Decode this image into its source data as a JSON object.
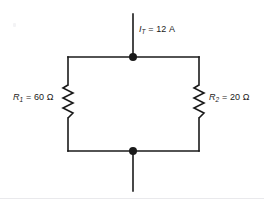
{
  "figure": {
    "type": "circuit-diagram",
    "background_color": "#ffffff",
    "line_color": "#1a1a1a"
  },
  "labels": {
    "current": {
      "symbol": "I",
      "subscript": "T",
      "equals": " = ",
      "value": "12",
      "unit": "A",
      "full_text": "IT = 12 A"
    },
    "resistor_left": {
      "symbol": "R",
      "subscript": "1",
      "equals": " = ",
      "value": "60",
      "unit": "Ω",
      "full_text": "R1 = 60 Ω"
    },
    "resistor_right": {
      "symbol": "R",
      "subscript": "2",
      "equals": " = ",
      "value": "20",
      "unit": "Ω",
      "full_text": "R2 = 20 Ω"
    }
  },
  "geometry": {
    "top_node": {
      "x": 133,
      "y": 57,
      "radius": 4
    },
    "bottom_node": {
      "x": 133,
      "y": 151,
      "radius": 4
    },
    "top_lead": {
      "x": 133,
      "y1": 14,
      "y2": 57
    },
    "bottom_lead": {
      "x": 133,
      "y1": 151,
      "y2": 191
    },
    "top_wire": {
      "y": 57,
      "x1": 68,
      "x2": 199
    },
    "bottom_wire": {
      "y": 151,
      "x1": 68,
      "x2": 199
    },
    "left_branch_x": 68,
    "right_branch_x": 199,
    "resistor_top_y": 85,
    "resistor_bottom_y": 118,
    "resistor_amplitude": 5,
    "stroke_width": 1.6
  }
}
